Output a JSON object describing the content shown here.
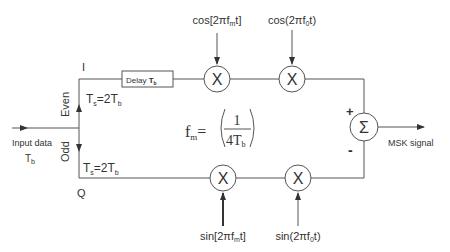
{
  "diagram": {
    "input": {
      "label": "Input data",
      "period": "T",
      "period_sub": "b"
    },
    "branches": {
      "i_label": "I",
      "q_label": "Q",
      "even_label": "Even",
      "odd_label": "Odd",
      "i_symbol_period": {
        "main": "T",
        "sub": "s",
        "eq": "=2T",
        "sub2": "b"
      },
      "q_symbol_period": {
        "main": "T",
        "sub": "s",
        "eq": "=2T",
        "sub2": "b"
      }
    },
    "delay_block": {
      "label": "Delay ",
      "value": "T",
      "value_sub": "b"
    },
    "multipliers": {
      "symbol": "X",
      "top_1_carrier": {
        "pre": "cos[2πf",
        "sub": "m",
        "post": "t]"
      },
      "top_2_carrier": {
        "pre": "cos(2πf",
        "sub": "0",
        "post": "t)"
      },
      "bottom_1_carrier": {
        "pre": "sin[2πf",
        "sub": "m",
        "post": "t]"
      },
      "bottom_2_carrier": {
        "pre": "sin(2πf",
        "sub": "0",
        "post": "t)"
      }
    },
    "formula": {
      "lhs": "f",
      "lhs_sub": "m",
      "eq": "=",
      "numerator": "1",
      "denominator": "4T",
      "denominator_sub": "b"
    },
    "summer": {
      "symbol": "Σ",
      "plus": "+",
      "minus": "-"
    },
    "output": {
      "label": "MSK signal"
    }
  }
}
